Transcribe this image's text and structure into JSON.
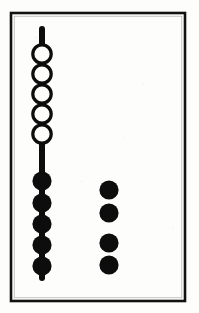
{
  "figure": {
    "title": "Bead rod diagram",
    "caption": "",
    "width": 199,
    "height": 313,
    "background_color": "#fdfdfc",
    "ink_color": "#0d0d0d"
  },
  "frame": {
    "label": "diagram-border",
    "x": 11,
    "y": 13,
    "width": 174,
    "height": 288,
    "stroke_color": "#111111",
    "stroke_width": 2.6,
    "fill_color": "#fdfdfc"
  },
  "rod": {
    "label": "vertical-rod",
    "x_center": 42,
    "y_top": 29,
    "y_bottom": 278,
    "thickness": 6,
    "color": "#0d0d0d"
  },
  "groups": [
    {
      "id": "open-beads-on-rod",
      "label": "Open beads on rod",
      "style": "open",
      "count": 5,
      "fill_color": "#fdfdfc",
      "stroke_color": "#0d0d0d",
      "stroke_width": 3.2,
      "radius": 9.2,
      "x_center": 42,
      "y_centers": [
        54,
        74,
        94,
        114,
        134
      ]
    },
    {
      "id": "filled-beads-on-rod",
      "label": "Filled beads on rod",
      "style": "filled",
      "count": 5,
      "fill_color": "#0d0d0d",
      "stroke_color": "#0d0d0d",
      "stroke_width": 0,
      "radius": 9.6,
      "x_center": 42,
      "y_centers": [
        181,
        203,
        224,
        245,
        266
      ]
    },
    {
      "id": "free-beads-column",
      "label": "Free filled beads beside rod",
      "style": "filled",
      "count": 4,
      "fill_color": "#0d0d0d",
      "stroke_color": "#0d0d0d",
      "stroke_width": 0,
      "radius": 9.6,
      "x_center": 109,
      "y_centers": [
        190,
        213,
        243,
        265
      ]
    }
  ],
  "counts": {
    "open_on_rod": 5,
    "filled_on_rod": 5,
    "free_filled": 4,
    "total_beads": 14
  }
}
